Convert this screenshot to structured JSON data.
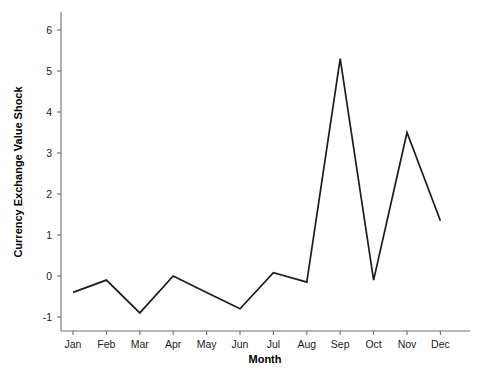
{
  "chart_data": {
    "type": "line",
    "title": "",
    "subtitle": "",
    "xlabel": "Month",
    "ylabel": "Currency Exchange Value Shock",
    "categories": [
      "Jan",
      "Feb",
      "Mar",
      "Apr",
      "May",
      "Jun",
      "Jul",
      "Aug",
      "Sep",
      "Oct",
      "Nov",
      "Dec"
    ],
    "values": [
      -0.4,
      -0.1,
      -0.9,
      0.0,
      -0.4,
      -0.8,
      0.08,
      -0.15,
      5.3,
      -0.1,
      3.5,
      1.35
    ],
    "series": [
      {
        "name": "Currency Exchange Value Shock",
        "values": [
          -0.4,
          -0.1,
          -0.9,
          0.0,
          -0.4,
          -0.8,
          0.08,
          -0.15,
          5.3,
          -0.1,
          3.5,
          1.35
        ]
      }
    ],
    "xtick_labels": [
      "Jan",
      "Feb",
      "Mar",
      "Apr",
      "May",
      "Jun",
      "Jul",
      "Aug",
      "Sep",
      "Oct",
      "Nov",
      "Dec"
    ],
    "ytick_labels": [
      "-1",
      "0",
      "1",
      "2",
      "3",
      "4",
      "5",
      "6"
    ],
    "ytick_values": [
      -1,
      0,
      1,
      2,
      3,
      4,
      5,
      6
    ],
    "ylim": [
      -1.35,
      6.3
    ],
    "xlim": [
      0.5,
      12.5
    ],
    "grid": false,
    "legend": false,
    "legend_position": "none",
    "line_color": "#1c1c1c",
    "axis_color": "#6e6e6e",
    "background_color": "#ffffff"
  },
  "axis": {
    "x_title": "Month",
    "y_title": "Currency Exchange Value Shock"
  }
}
